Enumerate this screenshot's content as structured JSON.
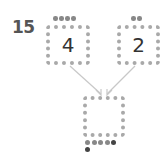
{
  "question_number": "15",
  "boxes": [
    {
      "id": "top-left",
      "value": "4",
      "dots": 4
    },
    {
      "id": "top-right",
      "value": "2",
      "dots": 2
    },
    {
      "id": "bottom",
      "value": "",
      "dots": 6
    }
  ],
  "colors": {
    "box_border": "#a9a9a9",
    "dot": "#888888",
    "dot_dark": "#444444",
    "arrow": "#c8c8c8",
    "number_text": "#555555"
  }
}
